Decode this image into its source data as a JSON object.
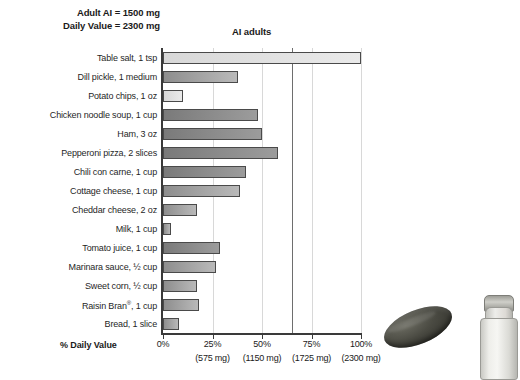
{
  "header": {
    "note_line1": "Adult AI = 1500 mg",
    "note_line2": "Daily Value = 2300 mg",
    "ai_marker_label": "AI adults"
  },
  "axis": {
    "x_title": "% Daily Value",
    "ticks": [
      {
        "percent": "0%",
        "mg": ""
      },
      {
        "percent": "25%",
        "mg": "(575 mg)"
      },
      {
        "percent": "50%",
        "mg": "(1150 mg)"
      },
      {
        "percent": "75%",
        "mg": "(1725 mg)"
      },
      {
        "percent": "100%",
        "mg": "(2300 mg)"
      }
    ]
  },
  "decor": {
    "pickle_name": "dill-pickle-photo",
    "shaker_name": "salt-shaker-photo"
  },
  "chart_data": {
    "type": "bar",
    "orientation": "horizontal",
    "title": "",
    "xlabel": "% Daily Value",
    "ylabel": "",
    "xlim": [
      0,
      100
    ],
    "grid": true,
    "legend": "none",
    "annotations": [
      {
        "label": "Adult AI = 1500 mg",
        "type": "note"
      },
      {
        "label": "Daily Value = 2300 mg",
        "type": "note"
      },
      {
        "label": "AI adults",
        "type": "vertical-line",
        "value": 65.2
      }
    ],
    "tick_values": [
      0,
      25,
      50,
      75,
      100
    ],
    "tick_labels": [
      "0%",
      "25%",
      "50%",
      "75%",
      "100%"
    ],
    "tick_sublabels": [
      "",
      "(575 mg)",
      "(1150 mg)",
      "(1725 mg)",
      "(2300 mg)"
    ],
    "categories": [
      "Table salt, 1 tsp",
      "Dill pickle, 1 medium",
      "Potato chips, 1 oz",
      "Chicken noodle soup, 1 cup",
      "Ham, 3 oz",
      "Pepperoni pizza, 2 slices",
      "Chili con carne, 1 cup",
      "Cottage cheese, 1 cup",
      "Cheddar cheese, 2 oz",
      "Milk, 1 cup",
      "Tomato juice, 1 cup",
      "Marinara sauce, ½ cup",
      "Sweet corn, ½ cup",
      "Raisin Bran®, 1 cup",
      "Bread, 1 slice"
    ],
    "values": [
      100,
      38,
      10,
      48,
      50,
      58,
      42,
      39,
      17,
      4,
      29,
      27,
      17,
      18,
      8
    ],
    "bar_shades": [
      "light",
      "mid",
      "light",
      "dark",
      "dark",
      "dark",
      "dark",
      "mid",
      "mid",
      "mid",
      "dark",
      "mid",
      "mid",
      "mid",
      "mid"
    ]
  }
}
